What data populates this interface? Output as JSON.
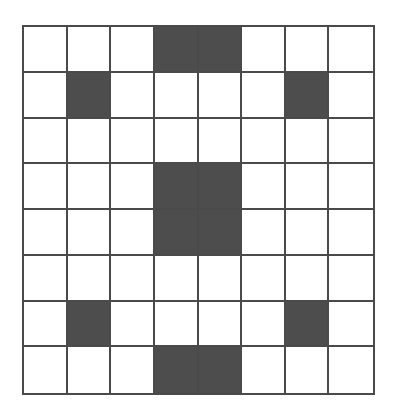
{
  "grid": {
    "rows": 8,
    "cols": 8,
    "filled_color": "#4d4d4d",
    "empty_color": "#ffffff",
    "line_color": "#4a4a4a",
    "filled_cells": [
      [
        0,
        3
      ],
      [
        0,
        4
      ],
      [
        1,
        1
      ],
      [
        1,
        6
      ],
      [
        3,
        3
      ],
      [
        3,
        4
      ],
      [
        4,
        3
      ],
      [
        4,
        4
      ],
      [
        6,
        1
      ],
      [
        6,
        6
      ],
      [
        7,
        3
      ],
      [
        7,
        4
      ]
    ]
  }
}
